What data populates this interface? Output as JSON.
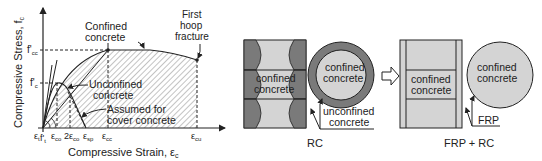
{
  "stress_strain": {
    "y_axis_label": "Compressive Stress, f",
    "y_axis_sub": "c",
    "x_axis_label": "Compressive Strain, ε",
    "x_axis_sub": "c",
    "y_ticks": {
      "fcc": "f'",
      "fcc_sub": "cc",
      "fc": "f'",
      "fc_sub": "c",
      "ft": "f'",
      "ft_sub": "t"
    },
    "x_ticks": {
      "et": "ε",
      "et_sub": "t",
      "eco": "ε",
      "eco_sub": "co",
      "two_eco": "2ε",
      "two_eco_sub": "co",
      "esp": "ε",
      "esp_sub": "sp",
      "ecc": "ε",
      "ecc_sub": "cc",
      "ecu": "ε",
      "ecu_sub": "cu"
    },
    "annotations": {
      "confined_1": "Confined",
      "confined_2": "concrete",
      "first_1": "First",
      "first_2": "hoop",
      "first_3": "fracture",
      "unconfined_1": "Unconfined",
      "unconfined_2": "concrete",
      "assumed_1": "Assumed for",
      "assumed_2": "cover concrete"
    }
  },
  "rc": {
    "label": "RC",
    "inner_1": "confined",
    "inner_2": "concrete",
    "circle_1": "confined",
    "circle_2": "concrete",
    "callout_1": "unconfined",
    "callout_2": "concrete"
  },
  "frp": {
    "label": "FRP + RC",
    "inner_1": "confined",
    "inner_2": "concrete",
    "circle_1": "confined",
    "circle_2": "concrete",
    "callout": "FRP"
  },
  "colors": {
    "dark_gray": "#7a7a7a",
    "light_gray": "#d4d4d4",
    "line": "#222222"
  }
}
